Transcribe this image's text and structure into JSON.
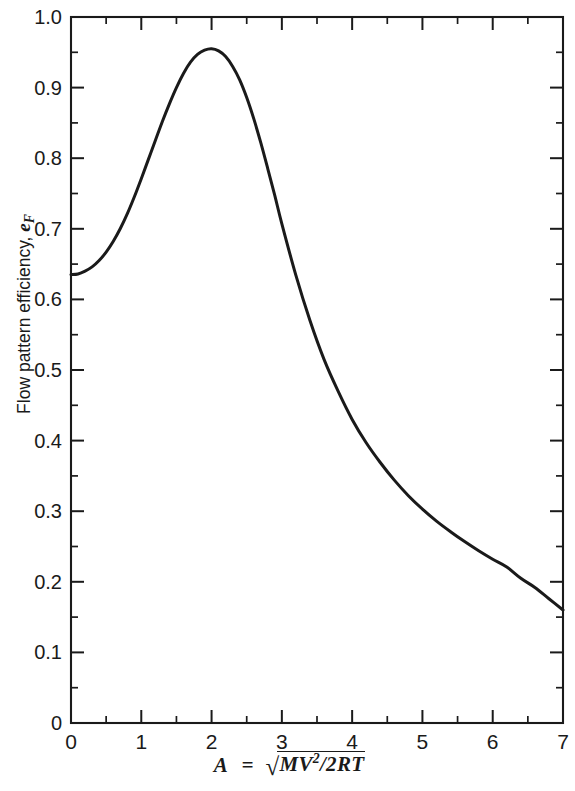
{
  "chart_data": {
    "type": "line",
    "title": "",
    "subtitle": "",
    "xlabel_plain": "A = sqrt(MV^2/2RT)",
    "ylabel_plain": "Flow pattern efficiency, eF",
    "xlim": [
      0,
      7
    ],
    "ylim": [
      0,
      1.0
    ],
    "grid": false,
    "legend": "none",
    "x_major_ticks": [
      0,
      1,
      2,
      3,
      4,
      5,
      6,
      7
    ],
    "x_minor_step": 0.5,
    "y_major_ticks": [
      0,
      0.1,
      0.2,
      0.3,
      0.4,
      0.5,
      0.6,
      0.7,
      0.8,
      0.9,
      1.0
    ],
    "y_minor_step": 0.05,
    "x_tick_labels": [
      "0",
      "1",
      "2",
      "3",
      "4",
      "5",
      "6",
      "7"
    ],
    "y_tick_labels": [
      "0",
      "0.1",
      "0.2",
      "0.3",
      "0.4",
      "0.5",
      "0.6",
      "0.7",
      "0.8",
      "0.9",
      "1.0"
    ],
    "series": [
      {
        "name": "Flow pattern efficiency",
        "color": "#1a1a1a",
        "x": [
          0.0,
          0.1,
          0.2,
          0.3,
          0.4,
          0.5,
          0.6,
          0.7,
          0.8,
          0.9,
          1.0,
          1.1,
          1.2,
          1.3,
          1.4,
          1.5,
          1.6,
          1.7,
          1.8,
          1.9,
          2.0,
          2.1,
          2.2,
          2.3,
          2.4,
          2.5,
          2.6,
          2.7,
          2.8,
          2.9,
          3.0,
          3.2,
          3.4,
          3.6,
          3.8,
          4.0,
          4.2,
          4.4,
          4.6,
          4.8,
          5.0,
          5.2,
          5.4,
          5.6,
          5.8,
          6.0,
          6.2,
          6.4,
          6.6,
          6.8,
          7.0
        ],
        "y": [
          0.635,
          0.636,
          0.64,
          0.646,
          0.655,
          0.667,
          0.682,
          0.7,
          0.721,
          0.745,
          0.771,
          0.798,
          0.825,
          0.852,
          0.877,
          0.9,
          0.92,
          0.936,
          0.947,
          0.953,
          0.955,
          0.952,
          0.944,
          0.93,
          0.911,
          0.886,
          0.856,
          0.822,
          0.785,
          0.747,
          0.707,
          0.634,
          0.57,
          0.515,
          0.47,
          0.43,
          0.397,
          0.369,
          0.344,
          0.322,
          0.303,
          0.286,
          0.271,
          0.257,
          0.244,
          0.232,
          0.221,
          0.205,
          0.192,
          0.176,
          0.16
        ]
      }
    ],
    "peak": {
      "x": 2.0,
      "y": 0.955
    },
    "start_value": {
      "x": 0.0,
      "y": 0.635
    },
    "end_value": {
      "x": 7.0,
      "y": 0.16
    }
  },
  "axes": {
    "y_title_text": "Flow pattern efficiency,",
    "y_title_symbol": "e",
    "y_title_subscript": "F",
    "x_title_variable": "A",
    "x_title_equals": "=",
    "x_title_radical_sign": "√",
    "x_title_numerator_m": "M",
    "x_title_numerator_v": "V",
    "x_title_exponent": "2",
    "x_title_slash": "/",
    "x_title_denominator": "2RT"
  },
  "style": {
    "axis_color": "#1a1a1a",
    "curve_color": "#1a1a1a",
    "background": "#ffffff"
  }
}
